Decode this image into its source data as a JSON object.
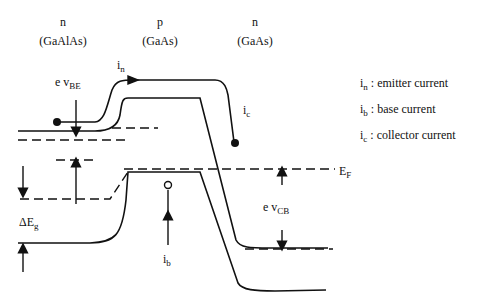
{
  "regions": [
    {
      "type": "n",
      "material": "(GaAlAs)"
    },
    {
      "type": "p",
      "material": "(GaAs)"
    },
    {
      "type": "n",
      "material": "(GaAs)"
    }
  ],
  "labels": {
    "in_main": "i",
    "in_sub": "n",
    "evbe_main": "e v",
    "evbe_sub": "BE",
    "ic_main": "i",
    "ic_sub": "c",
    "ib_main": "i",
    "ib_sub": "b",
    "ef_main": "E",
    "ef_sub": "F",
    "evcb_main": "e v",
    "evcb_sub": "CB",
    "deg_main": "ΔE",
    "deg_sub": "g"
  },
  "legend": [
    {
      "sym": "i",
      "sub": "n",
      "text": " : emitter current"
    },
    {
      "sym": "i",
      "sub": "b",
      "text": " : base current"
    },
    {
      "sym": "i",
      "sub": "c",
      "text": " : collector current"
    }
  ]
}
